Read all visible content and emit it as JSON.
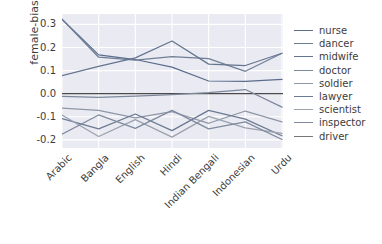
{
  "chart_data": {
    "type": "line",
    "title": "",
    "xlabel": "",
    "ylabel": "female-bias",
    "categories": [
      "Arabic",
      "Bangla",
      "English",
      "Hindi",
      "Indian Bengali",
      "Indonesian",
      "Urdu"
    ],
    "yticks": [
      "0.3",
      "0.2",
      "0.1",
      "0.0",
      "-0.1",
      "-0.2"
    ],
    "ytick_values": [
      0.3,
      0.2,
      0.1,
      0.0,
      -0.1,
      -0.2
    ],
    "ylim": [
      -0.235,
      0.345
    ],
    "grid": true,
    "grid_color": "#ffffff",
    "plot_background": "#eaeaf2",
    "legend_position": "right",
    "zero_line": 0.0,
    "series": [
      {
        "name": "nurse",
        "color": "#5a6d8c",
        "values": [
          0.322,
          0.168,
          0.148,
          0.115,
          0.055,
          0.053,
          0.062
        ]
      },
      {
        "name": "dancer",
        "color": "#6f7f96",
        "values": [
          0.323,
          0.158,
          0.145,
          0.16,
          0.152,
          0.097,
          0.175
        ]
      },
      {
        "name": "midwife",
        "color": "#64758f",
        "values": [
          0.078,
          0.118,
          0.155,
          0.228,
          0.128,
          0.122,
          0.175
        ]
      },
      {
        "name": "doctor",
        "color": "#7c889b",
        "values": [
          -0.012,
          -0.016,
          -0.01,
          -0.004,
          0.005,
          0.018,
          -0.058
        ]
      },
      {
        "name": "soldier",
        "color": "#8e97a6",
        "values": [
          -0.062,
          -0.072,
          -0.105,
          -0.078,
          -0.128,
          -0.075,
          -0.122
        ]
      },
      {
        "name": "lawyer",
        "color": "#6b7992",
        "values": [
          -0.108,
          -0.152,
          -0.088,
          -0.16,
          -0.072,
          -0.11,
          -0.182
        ]
      },
      {
        "name": "scientist",
        "color": "#9aa2ae",
        "values": [
          -0.092,
          -0.185,
          -0.112,
          -0.188,
          -0.098,
          -0.148,
          -0.172
        ]
      },
      {
        "name": "inspector",
        "color": "#7e8a9d",
        "values": [
          -0.175,
          -0.092,
          -0.15,
          -0.072,
          -0.152,
          -0.122,
          -0.198
        ]
      },
      {
        "name": "driver",
        "color": "#869０a0",
        "values": [
          -0.185,
          -0.188,
          -0.205,
          -0.198,
          -0.182,
          -0.158,
          -0.215
        ]
      }
    ]
  },
  "legend": {
    "items": [
      {
        "label": "nurse"
      },
      {
        "label": "dancer"
      },
      {
        "label": "midwife"
      },
      {
        "label": "doctor"
      },
      {
        "label": "soldier"
      },
      {
        "label": "lawyer"
      },
      {
        "label": "scientist"
      },
      {
        "label": "inspector"
      },
      {
        "label": "driver"
      }
    ]
  }
}
